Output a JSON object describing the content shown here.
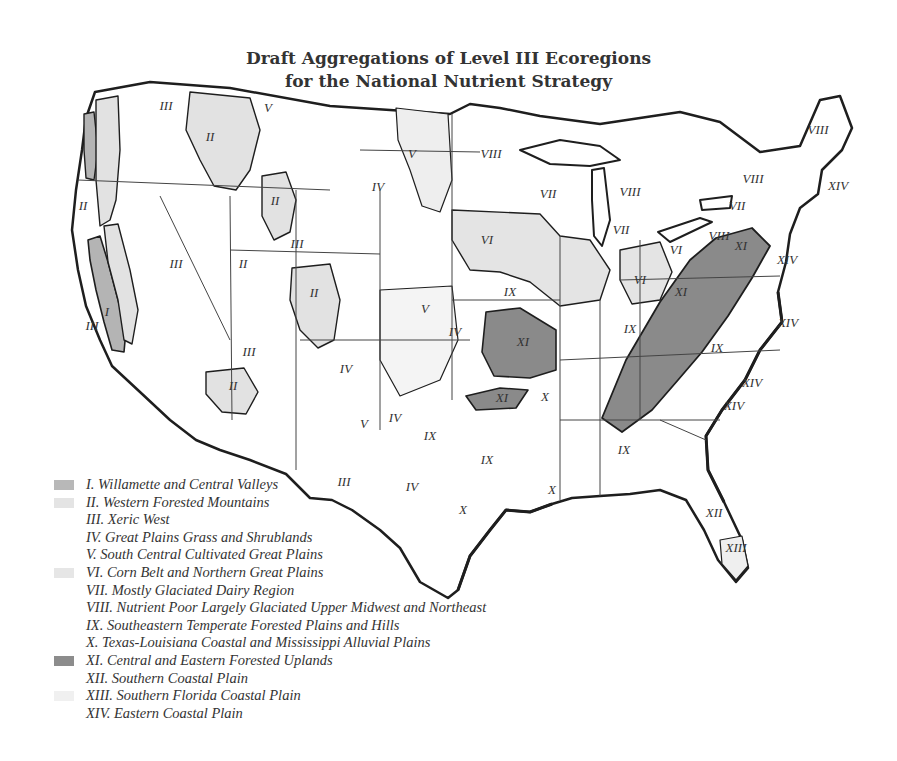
{
  "figure": {
    "title_line1": "Draft Aggregations of Level III Ecoregions",
    "title_line2": "for the National Nutrient Strategy"
  },
  "legend": {
    "items": [
      {
        "numeral": "I",
        "label": "I. Willamette and Central Valleys",
        "color": "#b8b8b8",
        "swatch": true
      },
      {
        "numeral": "II",
        "label": "II. Western Forested Mountains",
        "color": "#e4e4e4",
        "swatch": true
      },
      {
        "numeral": "III",
        "label": "III. Xeric West",
        "color": "#ffffff",
        "swatch": false
      },
      {
        "numeral": "IV",
        "label": "IV. Great Plains Grass and Shrublands",
        "color": "#ffffff",
        "swatch": false
      },
      {
        "numeral": "V",
        "label": "V. South Central Cultivated Great Plains",
        "color": "#f6f6f6",
        "swatch": false
      },
      {
        "numeral": "VI",
        "label": "VI. Corn Belt and Northern Great Plains",
        "color": "#e6e6e6",
        "swatch": true
      },
      {
        "numeral": "VII",
        "label": "VII. Mostly Glaciated Dairy Region",
        "color": "#ffffff",
        "swatch": false
      },
      {
        "numeral": "VIII",
        "label": "VIII. Nutrient Poor Largely Glaciated Upper Midwest and Northeast",
        "color": "#ffffff",
        "swatch": false
      },
      {
        "numeral": "IX",
        "label": "IX. Southeastern Temperate Forested Plains and Hills",
        "color": "#ffffff",
        "swatch": false
      },
      {
        "numeral": "X",
        "label": "X. Texas-Louisiana Coastal and Mississippi Alluvial Plains",
        "color": "#ffffff",
        "swatch": false
      },
      {
        "numeral": "XI",
        "label": "XI. Central and Eastern Forested Uplands",
        "color": "#8c8c8c",
        "swatch": true
      },
      {
        "numeral": "XII",
        "label": "XII. Southern Coastal Plain",
        "color": "#ffffff",
        "swatch": false
      },
      {
        "numeral": "XIII",
        "label": "XIII. Southern Florida Coastal Plain",
        "color": "#f0f0f0",
        "swatch": true
      },
      {
        "numeral": "XIV",
        "label": "XIV. Eastern Coastal Plain",
        "color": "#ffffff",
        "swatch": false
      }
    ]
  },
  "map": {
    "labels": [
      {
        "text": "III",
        "x": 166,
        "y": 110
      },
      {
        "text": "II",
        "x": 210,
        "y": 141
      },
      {
        "text": "V",
        "x": 268,
        "y": 112
      },
      {
        "text": "V",
        "x": 412,
        "y": 158
      },
      {
        "text": "VIII",
        "x": 491,
        "y": 158
      },
      {
        "text": "IV",
        "x": 378,
        "y": 191
      },
      {
        "text": "II",
        "x": 83,
        "y": 210
      },
      {
        "text": "II",
        "x": 275,
        "y": 205
      },
      {
        "text": "III",
        "x": 297,
        "y": 248
      },
      {
        "text": "III",
        "x": 176,
        "y": 268
      },
      {
        "text": "II",
        "x": 243,
        "y": 268
      },
      {
        "text": "II",
        "x": 314,
        "y": 297
      },
      {
        "text": "VII",
        "x": 548,
        "y": 198
      },
      {
        "text": "VIII",
        "x": 630,
        "y": 196
      },
      {
        "text": "VII",
        "x": 621,
        "y": 234
      },
      {
        "text": "VI",
        "x": 487,
        "y": 244
      },
      {
        "text": "VIII",
        "x": 753,
        "y": 183
      },
      {
        "text": "VII",
        "x": 737,
        "y": 210
      },
      {
        "text": "VIII",
        "x": 818,
        "y": 134
      },
      {
        "text": "XIV",
        "x": 838,
        "y": 190
      },
      {
        "text": "VIII",
        "x": 719,
        "y": 240
      },
      {
        "text": "XI",
        "x": 741,
        "y": 250
      },
      {
        "text": "VI",
        "x": 676,
        "y": 254
      },
      {
        "text": "VI",
        "x": 640,
        "y": 284
      },
      {
        "text": "XI",
        "x": 681,
        "y": 296
      },
      {
        "text": "XIV",
        "x": 787,
        "y": 264
      },
      {
        "text": "IX",
        "x": 510,
        "y": 296
      },
      {
        "text": "V",
        "x": 425,
        "y": 313
      },
      {
        "text": "IV",
        "x": 455,
        "y": 336
      },
      {
        "text": "XI",
        "x": 523,
        "y": 346
      },
      {
        "text": "IX",
        "x": 630,
        "y": 333
      },
      {
        "text": "XIV",
        "x": 788,
        "y": 327
      },
      {
        "text": "IX",
        "x": 717,
        "y": 352
      },
      {
        "text": "III",
        "x": 249,
        "y": 356
      },
      {
        "text": "II",
        "x": 233,
        "y": 390
      },
      {
        "text": "IV",
        "x": 346,
        "y": 373
      },
      {
        "text": "XI",
        "x": 502,
        "y": 402
      },
      {
        "text": "X",
        "x": 545,
        "y": 401
      },
      {
        "text": "XIV",
        "x": 752,
        "y": 387
      },
      {
        "text": "XIV",
        "x": 734,
        "y": 410
      },
      {
        "text": "IV",
        "x": 395,
        "y": 422
      },
      {
        "text": "V",
        "x": 364,
        "y": 428
      },
      {
        "text": "IX",
        "x": 430,
        "y": 440
      },
      {
        "text": "IX",
        "x": 487,
        "y": 464
      },
      {
        "text": "IX",
        "x": 624,
        "y": 454
      },
      {
        "text": "III",
        "x": 344,
        "y": 486
      },
      {
        "text": "IV",
        "x": 412,
        "y": 491
      },
      {
        "text": "X",
        "x": 552,
        "y": 494
      },
      {
        "text": "X",
        "x": 463,
        "y": 514
      },
      {
        "text": "XII",
        "x": 714,
        "y": 517
      },
      {
        "text": "XIII",
        "x": 736,
        "y": 552
      },
      {
        "text": "I",
        "x": 107,
        "y": 316
      },
      {
        "text": "III",
        "x": 92,
        "y": 330
      }
    ]
  }
}
